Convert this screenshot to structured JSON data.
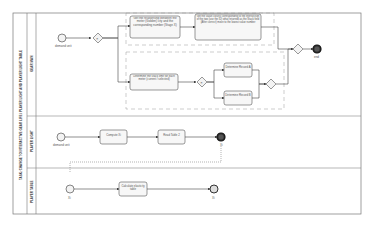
{
  "pool": {
    "title": "TASK: CHANGE TO INTERACTIVE GEAR LIFE / PLAYER LIGHT AND PLAYER LIGHT TABLE"
  },
  "lanes": [
    {
      "label": "GEAR MAN"
    },
    {
      "label": "PLAYER LIGHT"
    },
    {
      "label": "PLAYER TABLE"
    }
  ],
  "lane1": {
    "start_label": "demand unit",
    "task_a": "Get the relationship between the meter (Golden) city and the corresponding number (Stage X)",
    "task_b": "Get the value closest corresponding to the intersection of the two (use the ID) what returned as the Stack field (After correct) move to the lowest value number",
    "task_c": "Determine the stack limit for each meter (current / selected)",
    "task_d": "Determine Record A",
    "task_e": "Determine Record B",
    "end_label": "end"
  },
  "lane2": {
    "start_label": "demand unit",
    "task_a": "Compute Xi",
    "task_b": "Read Table 2",
    "end_label": "Xi"
  },
  "lane3": {
    "start_label": "Xi",
    "task_a": "Calculate elasticity table",
    "end_label": "Xi"
  },
  "colors": {
    "stroke": "#555555",
    "task_fill": "#f7f7f7",
    "end_fill": "#333333",
    "group_dash": "#888888"
  }
}
